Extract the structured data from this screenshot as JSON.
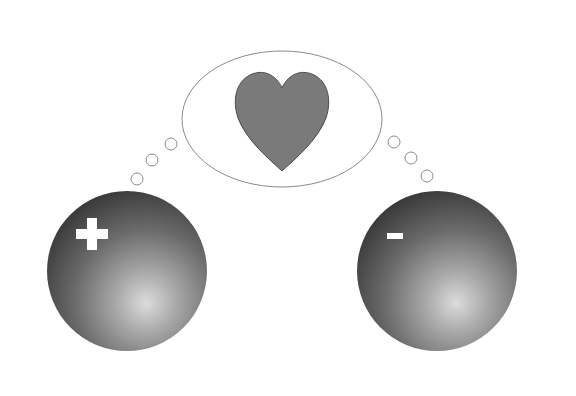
{
  "diagram": {
    "canvas": {
      "width": 576,
      "height": 396,
      "background": "#ffffff"
    },
    "thought_bubble": {
      "ellipse": {
        "cx": 282,
        "cy": 119,
        "rx": 100,
        "ry": 68,
        "stroke": "#8a8a8a",
        "fill": "#ffffff"
      },
      "heart": {
        "fill": "#7a7a7a",
        "stroke": "#4a4a4a",
        "icon": "heart-icon"
      },
      "left_trail": [
        {
          "cx": 171,
          "cy": 144,
          "r": 6
        },
        {
          "cx": 152,
          "cy": 160,
          "r": 6
        },
        {
          "cx": 137,
          "cy": 179,
          "r": 6
        }
      ],
      "right_trail": [
        {
          "cx": 394,
          "cy": 142,
          "r": 6
        },
        {
          "cx": 411,
          "cy": 158,
          "r": 6
        },
        {
          "cx": 427,
          "cy": 176,
          "r": 6
        }
      ]
    },
    "spheres": [
      {
        "name": "positive-sphere",
        "charge_symbol": "+",
        "charge": "positive",
        "cx": 127,
        "cy": 271,
        "r": 80,
        "color_dark": "#3c3c3c",
        "color_light": "#d6d6d6"
      },
      {
        "name": "negative-sphere",
        "charge_symbol": "-",
        "charge": "negative",
        "cx": 437,
        "cy": 271,
        "r": 80,
        "color_dark": "#3c3c3c",
        "color_light": "#d6d6d6"
      }
    ]
  }
}
